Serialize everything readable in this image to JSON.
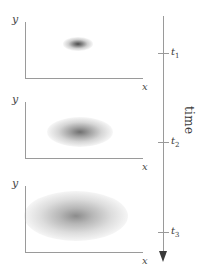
{
  "figure": {
    "kind": "diagram"
  },
  "panels": [
    {
      "id": "panel-1",
      "y_label": "y",
      "x_label": "x",
      "blob": {
        "spread": "narrow",
        "darkness": "dark"
      }
    },
    {
      "id": "panel-2",
      "y_label": "y",
      "x_label": "x",
      "blob": {
        "spread": "medium",
        "darkness": "medium"
      }
    },
    {
      "id": "panel-3",
      "y_label": "y",
      "x_label": "x",
      "blob": {
        "spread": "wide",
        "darkness": "light"
      }
    }
  ],
  "time_axis": {
    "label": "time",
    "ticks": [
      {
        "label": "t",
        "sub": "1"
      },
      {
        "label": "t",
        "sub": "2"
      },
      {
        "label": "t",
        "sub": "3"
      }
    ],
    "arrow_direction": "down"
  },
  "colors": {
    "axis": "#9a9a9a",
    "text": "#3a3a3a",
    "background": "#ffffff",
    "arrowhead": "#3a3a3a"
  }
}
